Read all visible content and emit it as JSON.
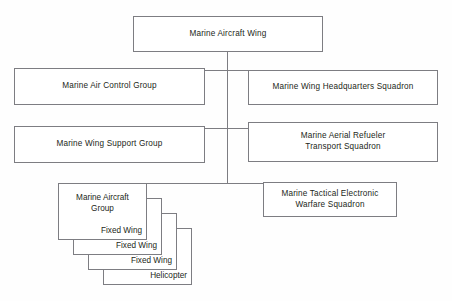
{
  "diagram": {
    "type": "organization-chart",
    "title_node": {
      "label": "Marine Aircraft Wing"
    },
    "colors": {
      "background": "#fefefe",
      "box_border": "#7d7d82",
      "box_fill": "#ffffff",
      "text": "#231f20",
      "connector": "#7d7d82"
    },
    "rows": [
      {
        "left": {
          "label": "Marine Air Control Group"
        },
        "right": {
          "label": "Marine Wing Headquarters Squadron"
        }
      },
      {
        "left": {
          "label": "Marine Wing Support Group"
        },
        "right": {
          "label": "Marine Aerial Refueler\nTransport Squadron"
        }
      },
      {
        "right": {
          "label": "Marine Tactical Electronic\nWarfare Squadron"
        }
      }
    ],
    "stack": {
      "title": "Marine Aircraft\nGroup",
      "layers": [
        {
          "label": "Fixed Wing"
        },
        {
          "label": "Fixed Wing"
        },
        {
          "label": "Fixed Wing"
        },
        {
          "label": "Helicopter"
        }
      ]
    },
    "caption": ""
  }
}
